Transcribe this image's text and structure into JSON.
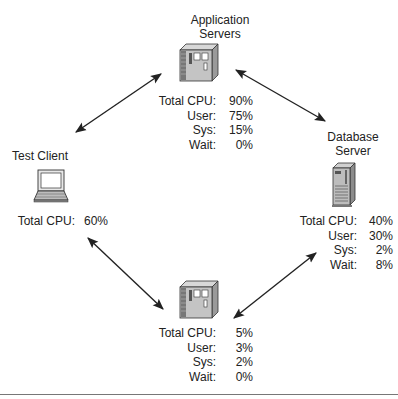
{
  "diagram": {
    "nodes": {
      "app_servers": {
        "title_line1": "Application",
        "title_line2": "Servers",
        "icon": "server-cabinet-icon",
        "stats": [
          {
            "label": "Total CPU:",
            "value": "90%"
          },
          {
            "label": "User:",
            "value": "75%"
          },
          {
            "label": "Sys:",
            "value": "15%"
          },
          {
            "label": "Wait:",
            "value": "0%"
          }
        ]
      },
      "test_client": {
        "title": "Test Client",
        "icon": "laptop-icon",
        "stats": [
          {
            "label": "Total CPU:",
            "value": "60%"
          }
        ]
      },
      "database_server": {
        "title_line1": "Database",
        "title_line2": "Server",
        "icon": "tower-server-icon",
        "stats": [
          {
            "label": "Total CPU:",
            "value": "40%"
          },
          {
            "label": "User:",
            "value": "30%"
          },
          {
            "label": "Sys:",
            "value": "2%"
          },
          {
            "label": "Wait:",
            "value": "8%"
          }
        ]
      },
      "bottom_server": {
        "icon": "server-cabinet-icon",
        "stats": [
          {
            "label": "Total CPU:",
            "value": "5%"
          },
          {
            "label": "User:",
            "value": "3%"
          },
          {
            "label": "Sys:",
            "value": "2%"
          },
          {
            "label": "Wait:",
            "value": "0%"
          }
        ]
      }
    },
    "edges": [
      {
        "from": "test_client",
        "to": "app_servers",
        "type": "bidirectional"
      },
      {
        "from": "app_servers",
        "to": "database_server",
        "type": "bidirectional"
      },
      {
        "from": "test_client",
        "to": "bottom_server",
        "type": "bidirectional"
      },
      {
        "from": "bottom_server",
        "to": "database_server",
        "type": "bidirectional"
      }
    ]
  }
}
